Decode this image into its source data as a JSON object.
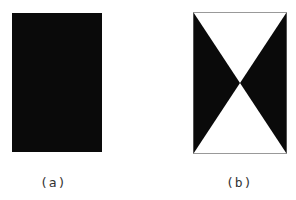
{
  "figures": [
    {
      "id": "a",
      "label": "(a)",
      "description": "solid black rectangle"
    },
    {
      "id": "b",
      "label": "(b)",
      "description": "rectangle with black left and right triangles meeting at center (hourglass/bowtie)"
    }
  ],
  "colors": {
    "fill": "#0a0a0a",
    "background": "#ffffff",
    "border": "#999999"
  }
}
